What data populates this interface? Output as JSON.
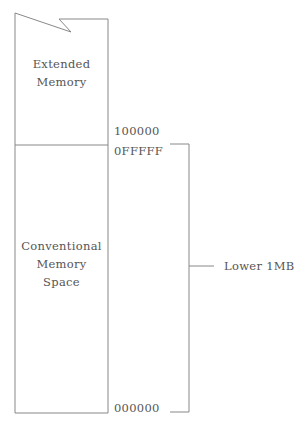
{
  "diagram": {
    "regions": [
      {
        "id": "extended",
        "label_lines": [
          "Extended",
          "Memory"
        ]
      },
      {
        "id": "conventional",
        "label_lines": [
          "Conventional",
          "Memory",
          "Space"
        ]
      }
    ],
    "addresses": {
      "boundary_upper": "100000",
      "boundary_lower": "0FFFFF",
      "base": "000000"
    },
    "bracket_label": "Lower 1MB",
    "line_color": "#888888"
  }
}
